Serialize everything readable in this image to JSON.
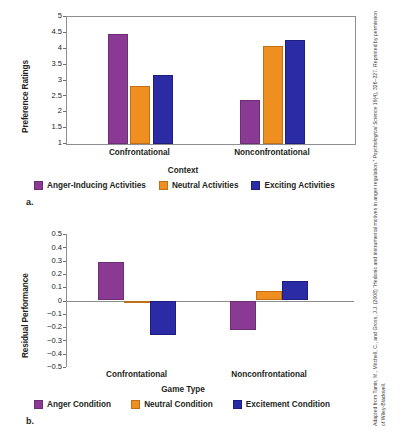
{
  "figure": {
    "credit_line1": "Adapted from Tamir, M., Mitchell, C., and Gross, J.J. (2008) “Hedonic and instrumental motives in anger regulation.” ",
    "credit_italic": "Psychological Science",
    "credit_line2": " 19(4), 326–327. Reprinted by permission of Wiley-Blackwell.",
    "panel_a_letter": "a.",
    "panel_b_letter": "b."
  },
  "colors": {
    "purple": "#8a3a93",
    "orange": "#ef8f1f",
    "blue": "#2b2ba6",
    "axis": "#8d8d92",
    "text": "#231f20"
  },
  "chart_data": [
    {
      "id": "panel-a",
      "type": "bar",
      "title": "",
      "xlabel": "Context",
      "ylabel": "Preference Ratings",
      "categories": [
        "Confrontational",
        "Nonconfrontational"
      ],
      "ylim": [
        1,
        5
      ],
      "yticks": [
        "5",
        "4.5",
        "4",
        "3.5",
        "3",
        "2.5",
        "2",
        "1.5",
        "1"
      ],
      "ytick_values": [
        5,
        4.5,
        4,
        3.5,
        3,
        2.5,
        2,
        1.5,
        1
      ],
      "grid": false,
      "legend_position": "bottom",
      "series": [
        {
          "name": "Anger-Inducing Activities",
          "color": "#8a3a93",
          "values": [
            4.47,
            2.4
          ]
        },
        {
          "name": "Neutral Activities",
          "color": "#ef8f1f",
          "values": [
            2.83,
            4.1
          ]
        },
        {
          "name": "Exciting Activities",
          "color": "#2b2ba6",
          "values": [
            3.17,
            4.27
          ]
        }
      ]
    },
    {
      "id": "panel-b",
      "type": "bar",
      "title": "",
      "xlabel": "Game Type",
      "ylabel": "Residual Performance",
      "categories": [
        "Confrontational",
        "Nonconfrontational"
      ],
      "ylim": [
        -0.5,
        0.5
      ],
      "yticks": [
        "0.5",
        "0.4",
        "0.3",
        "0.2",
        "0.1",
        "0",
        "−0.1",
        "−0.2",
        "−0.3",
        "−0.4",
        "−0.5"
      ],
      "ytick_values": [
        0.5,
        0.4,
        0.3,
        0.2,
        0.1,
        0,
        -0.1,
        -0.2,
        -0.3,
        -0.4,
        -0.5
      ],
      "grid": false,
      "legend_position": "bottom",
      "series": [
        {
          "name": "Anger Condition",
          "color": "#8a3a93",
          "values": [
            0.29,
            -0.22
          ]
        },
        {
          "name": "Neutral Condition",
          "color": "#ef8f1f",
          "values": [
            -0.02,
            0.07
          ]
        },
        {
          "name": "Excitement Condition",
          "color": "#2b2ba6",
          "values": [
            -0.26,
            0.145
          ]
        }
      ]
    }
  ]
}
